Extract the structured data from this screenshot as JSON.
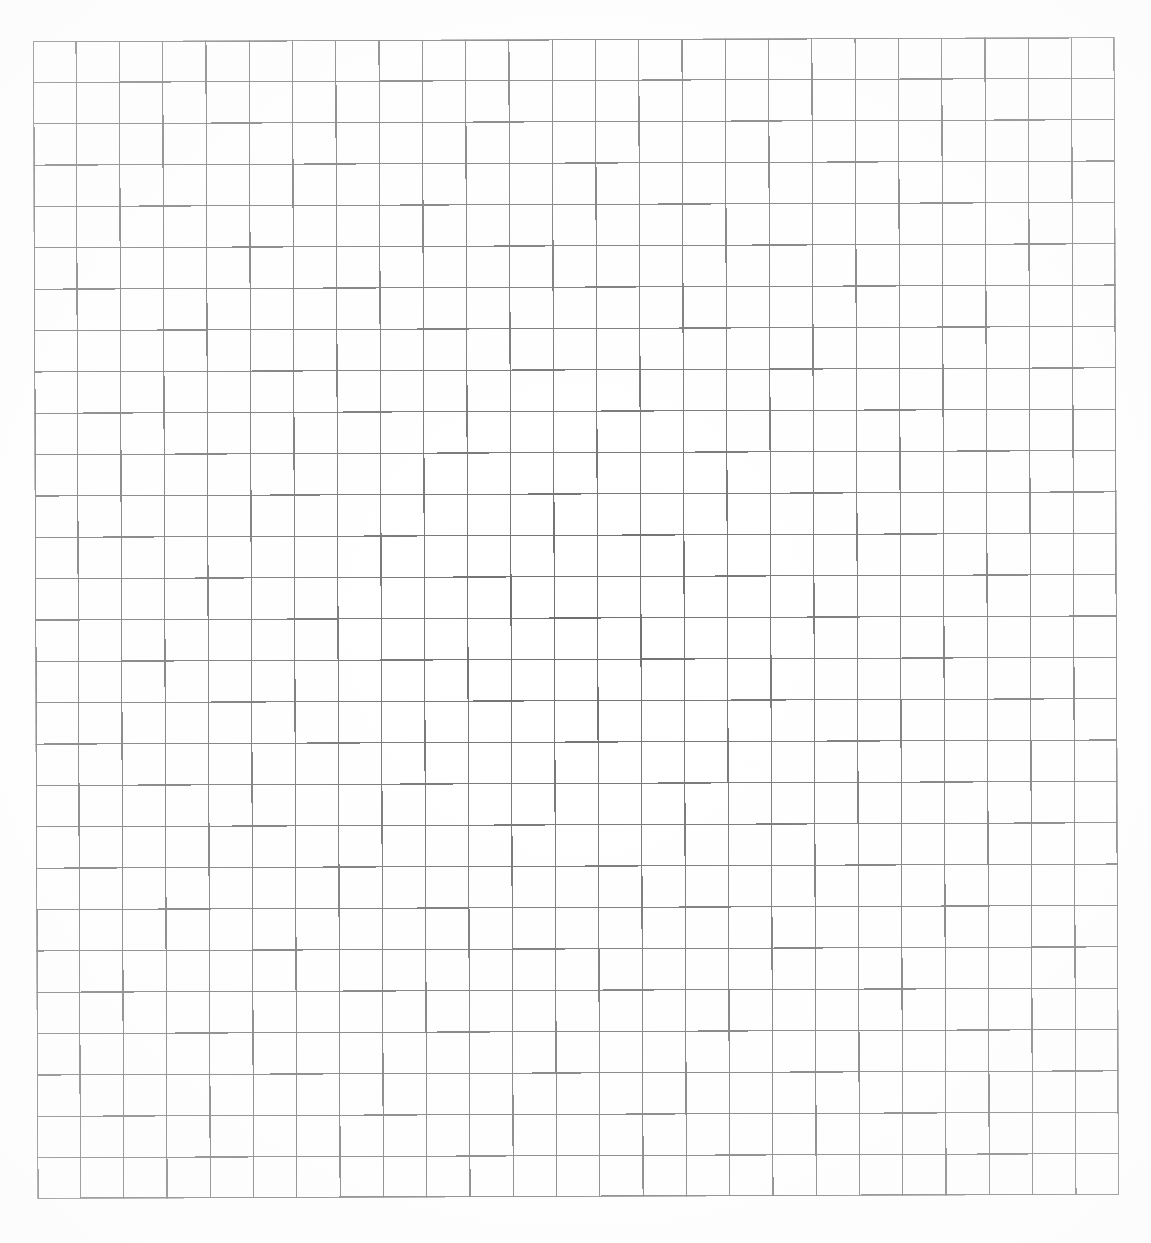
{
  "document": {
    "kind": "scanned-grid-paper",
    "background_color": "#ffffff",
    "width_px": 1151,
    "height_px": 1243,
    "title_text": "",
    "visible_text": []
  },
  "grid": {
    "name": "graph-paper-grid",
    "columns": 25,
    "rows": 28,
    "left_px": 35,
    "top_px": 39,
    "right_px": 1117,
    "bottom_px": 1197,
    "width_px": 1082,
    "height_px": 1158,
    "cell_width_px": 43.28,
    "cell_height_px": 41.36,
    "line_color": "#6e6e6e",
    "line_color_light": "#8a8a8a",
    "line_width_px": 1.2,
    "border_line_width_px": 1.4,
    "skew_degrees": -0.22,
    "cell_fill_color": "#ffffff"
  },
  "margins": {
    "left_px": 35,
    "top_px": 39,
    "right_px": 34,
    "bottom_px": 46
  },
  "chart_data": {
    "type": "table",
    "title": "",
    "xlabel": "",
    "ylabel": "",
    "columns": 25,
    "rows": 28,
    "categories": [],
    "values": [],
    "grid": true,
    "legend": "none",
    "note": "Blank scanned grid/graph paper: 25 columns by 28 rows of empty cells, no data plotted, no labels, no annotations."
  }
}
